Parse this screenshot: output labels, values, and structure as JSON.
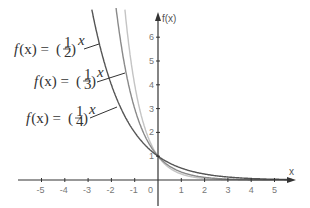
{
  "chart_data": {
    "type": "line",
    "title": "",
    "xlabel": "x",
    "ylabel": "f(x)",
    "xlim": [
      -6,
      6
    ],
    "ylim": [
      -1,
      7
    ],
    "grid": false,
    "x_ticks": [
      -5,
      -4,
      -3,
      -2,
      -1,
      0,
      1,
      2,
      3,
      4,
      5
    ],
    "x_tick_labels": [
      "-5",
      "-4",
      "-3",
      "-2",
      "-1",
      "0",
      "1",
      "2",
      "3",
      "4",
      "5"
    ],
    "y_ticks": [
      1,
      2,
      3,
      4,
      5,
      6
    ],
    "y_tick_labels": [
      "1",
      "2",
      "3",
      "4",
      "5",
      "6"
    ],
    "series": [
      {
        "name": "f(x) = (1/2)^x",
        "base_num": "1",
        "base_den": "2",
        "base": 0.5,
        "color": "#555555"
      },
      {
        "name": "f(x) = (1/3)^x",
        "base_num": "1",
        "base_den": "3",
        "base": 0.3333,
        "color": "#8a8a8a"
      },
      {
        "name": "f(x) = (1/4)^x",
        "base_num": "1",
        "base_den": "4",
        "base": 0.25,
        "color": "#c4c4c4"
      }
    ],
    "annotations": [
      {
        "text": "f(x) = (1/2)^x",
        "points_to": "f(x) = (1/2)^x"
      },
      {
        "text": "f(x) = (1/3)^x",
        "points_to": "f(x) = (1/4)^x"
      },
      {
        "text": "f(x) = (1/4)^x",
        "points_to": "f(x) = (1/3)^x"
      }
    ],
    "intersection": {
      "x": 0,
      "y": 1
    }
  },
  "labels": {
    "x_axis": "x",
    "y_axis": "f(x)",
    "fn_prefix": "f",
    "fn_arg": "(x) =",
    "exponent": "x"
  }
}
